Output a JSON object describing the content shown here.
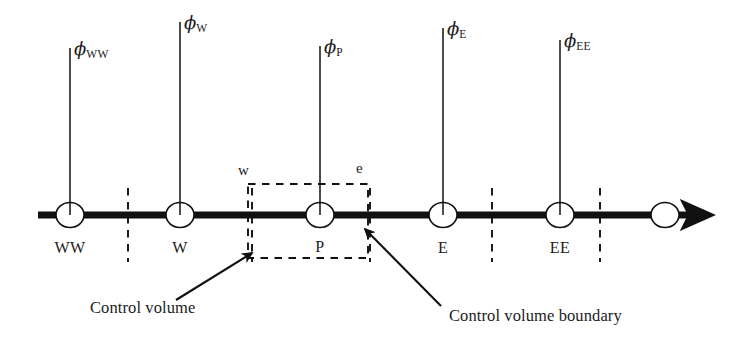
{
  "figure": {
    "type": "diagram",
    "background_color": "#ffffff",
    "ink_color": "#111111"
  },
  "axis": {
    "name": "x-axis-arrow",
    "x_start": 38,
    "x_end": 712,
    "y": 215,
    "thickness": 7,
    "arrowhead": "right"
  },
  "nodes": [
    {
      "id": "WW",
      "label": "WW",
      "x": 70,
      "phi_label_sub": "WW",
      "stem_top": 48
    },
    {
      "id": "W",
      "label": "W",
      "x": 180,
      "phi_label_sub": "W",
      "stem_top": 22
    },
    {
      "id": "P",
      "label": "P",
      "x": 320,
      "phi_label_sub": "P",
      "stem_top": 46
    },
    {
      "id": "E",
      "label": "E",
      "x": 443,
      "phi_label_sub": "E",
      "stem_top": 28
    },
    {
      "id": "EE",
      "label": "EE",
      "x": 560,
      "phi_label_sub": "EE",
      "stem_top": 40
    },
    {
      "id": "end",
      "label": "",
      "x": 665,
      "phi_label_sub": "",
      "stem_top": null
    }
  ],
  "phi_symbol": "ϕ",
  "phi_labels": [
    {
      "name": "phi-WW",
      "text": "ϕ",
      "sub": "WW",
      "x": 74,
      "y": 55
    },
    {
      "name": "phi-W",
      "text": "ϕ",
      "sub": "W",
      "x": 184,
      "y": 29
    },
    {
      "name": "phi-P",
      "text": "ϕ",
      "sub": "P",
      "x": 305,
      "y": 53
    },
    {
      "name": "phi-E",
      "text": "ϕ",
      "sub": "E",
      "x": 428,
      "y": 35
    },
    {
      "name": "phi-EE",
      "text": "ϕ",
      "sub": "EE",
      "x": 540,
      "y": 47
    }
  ],
  "node_name_labels": [
    {
      "name": "node-label-WW",
      "text": "WW",
      "x": 70,
      "y": 250
    },
    {
      "name": "node-label-W",
      "text": "W",
      "x": 180,
      "y": 250
    },
    {
      "name": "node-label-P",
      "text": "P",
      "x": 320,
      "y": 249
    },
    {
      "name": "node-label-E",
      "text": "E",
      "x": 443,
      "y": 250
    },
    {
      "name": "node-label-EE",
      "text": "EE",
      "x": 560,
      "y": 250
    }
  ],
  "cell_faces": {
    "dashed_lines_x": [
      128,
      252,
      370,
      492,
      600
    ],
    "dash_top": 188,
    "dash_bottom": 262
  },
  "control_volume": {
    "name": "control-volume-box",
    "left": 248,
    "right": 368,
    "top": 184,
    "bottom": 258,
    "style": "dashed",
    "face_labels": [
      {
        "name": "face-label-w",
        "text": "w",
        "x": 238,
        "y": 172
      },
      {
        "name": "face-label-e",
        "text": "e",
        "x": 357,
        "y": 170
      }
    ]
  },
  "annotations": [
    {
      "name": "control-volume-annotation",
      "text": "Control volume",
      "text_x": 90,
      "text_y": 310,
      "leader": {
        "x1": 176,
        "y1": 300,
        "x2": 252,
        "y2": 253
      }
    },
    {
      "name": "control-volume-boundary-annotation",
      "text": "Control volume boundary",
      "text_x": 449,
      "text_y": 318,
      "leader": {
        "x1": 441,
        "y1": 306,
        "x2": 365,
        "y2": 229
      }
    }
  ],
  "circle": {
    "rx": 14,
    "ry": 12.5,
    "fill": "#ffffff",
    "stroke": "#111111",
    "stroke_width": 1.6
  }
}
